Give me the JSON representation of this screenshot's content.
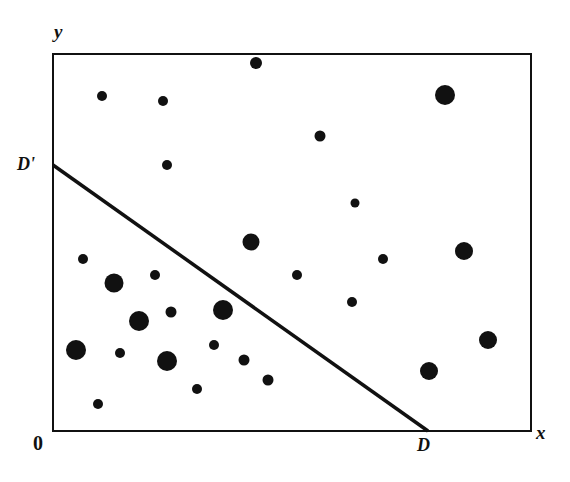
{
  "figure": {
    "kind": "scatter-plot-with-line",
    "background_color": "#ffffff",
    "ink_color": "#111111",
    "width": 570,
    "height": 482
  },
  "labels": {
    "y_axis": "y",
    "x_axis": "x",
    "origin": "0",
    "line_upper_end": "D'",
    "line_lower_end": "D"
  },
  "chart_data": {
    "type": "scatter",
    "title": "",
    "xlabel": "x",
    "ylabel": "y",
    "origin_label": "0",
    "grid": false,
    "legend": null,
    "axis_frame": {
      "left": 53,
      "right": 531,
      "top": 54,
      "bottom": 431,
      "stroke": "#111111",
      "stroke_width": 2,
      "closed_box": true
    },
    "xlim": [
      0,
      1
    ],
    "ylim": [
      0,
      1
    ],
    "marker_color": "#111111",
    "marker_shape": "circle",
    "point_count": 28,
    "points": [
      {
        "x": 0.103,
        "y": 0.888,
        "r": 5.0,
        "px": 102,
        "py": 96
      },
      {
        "x": 0.23,
        "y": 0.875,
        "r": 5.0,
        "px": 163,
        "py": 101
      },
      {
        "x": 0.425,
        "y": 0.976,
        "r": 6.0,
        "px": 256,
        "py": 63
      },
      {
        "x": 0.82,
        "y": 0.891,
        "r": 10.0,
        "px": 445,
        "py": 95
      },
      {
        "x": 0.238,
        "y": 0.706,
        "r": 5.0,
        "px": 167,
        "py": 165
      },
      {
        "x": 0.559,
        "y": 0.783,
        "r": 5.5,
        "px": 320,
        "py": 136
      },
      {
        "x": 0.632,
        "y": 0.605,
        "r": 4.5,
        "px": 355,
        "py": 203
      },
      {
        "x": 0.414,
        "y": 0.501,
        "r": 8.5,
        "px": 251,
        "py": 242
      },
      {
        "x": 0.86,
        "y": 0.48,
        "r": 9.0,
        "px": 464,
        "py": 251
      },
      {
        "x": 0.128,
        "y": 0.393,
        "r": 9.5,
        "px": 114,
        "py": 283
      },
      {
        "x": 0.213,
        "y": 0.414,
        "r": 5.0,
        "px": 155,
        "py": 275
      },
      {
        "x": 0.18,
        "y": 0.292,
        "r": 10.0,
        "px": 139,
        "py": 321
      },
      {
        "x": 0.247,
        "y": 0.316,
        "r": 5.5,
        "px": 171,
        "py": 312
      },
      {
        "x": 0.356,
        "y": 0.321,
        "r": 10.0,
        "px": 223,
        "py": 310
      },
      {
        "x": 0.048,
        "y": 0.218,
        "r": 10.0,
        "px": 76,
        "py": 350
      },
      {
        "x": 0.14,
        "y": 0.21,
        "r": 5.0,
        "px": 120,
        "py": 353
      },
      {
        "x": 0.238,
        "y": 0.186,
        "r": 10.0,
        "px": 167,
        "py": 361
      },
      {
        "x": 0.337,
        "y": 0.228,
        "r": 5.0,
        "px": 214,
        "py": 345
      },
      {
        "x": 0.4,
        "y": 0.191,
        "r": 5.5,
        "px": 244,
        "py": 360
      },
      {
        "x": 0.45,
        "y": 0.138,
        "r": 5.5,
        "px": 268,
        "py": 380
      },
      {
        "x": 0.094,
        "y": 0.072,
        "r": 5.0,
        "px": 98,
        "py": 404
      },
      {
        "x": 0.626,
        "y": 0.342,
        "r": 5.0,
        "px": 352,
        "py": 302
      },
      {
        "x": 0.911,
        "y": 0.241,
        "r": 9.0,
        "px": 488,
        "py": 340
      },
      {
        "x": 0.787,
        "y": 0.159,
        "r": 9.0,
        "px": 429,
        "py": 371
      },
      {
        "x": 0.302,
        "y": 0.121,
        "r": 5.0,
        "px": 197,
        "py": 389
      },
      {
        "x": 0.51,
        "y": 0.415,
        "r": 5.0,
        "px": 297,
        "py": 275
      },
      {
        "x": 0.69,
        "y": 0.455,
        "r": 5.0,
        "px": 383,
        "py": 259
      },
      {
        "x": 0.063,
        "y": 0.455,
        "r": 5.0,
        "px": 83,
        "py": 259
      }
    ],
    "annotations": [
      {
        "name": "discriminant-line",
        "label_start": "D'",
        "label_end": "D",
        "x1_px": 53,
        "y1_px": 165,
        "x2_px": 428,
        "y2_px": 431,
        "stroke": "#111111",
        "stroke_width": 3.5
      }
    ]
  }
}
